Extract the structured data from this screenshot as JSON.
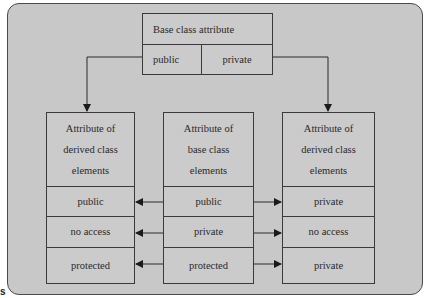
{
  "diagram": {
    "top_box": {
      "title": "Base class attribute",
      "cells": [
        "public",
        "private"
      ]
    },
    "columns": [
      {
        "id": "left",
        "header": [
          "Attribute of",
          "derived class",
          "elements"
        ],
        "rows": [
          "public",
          "no access",
          "protected"
        ]
      },
      {
        "id": "center",
        "header": [
          "Attribute of",
          "base class",
          "elements"
        ],
        "rows": [
          "public",
          "private",
          "protected"
        ]
      },
      {
        "id": "right",
        "header": [
          "Attribute of",
          "derived class",
          "elements"
        ],
        "rows": [
          "private",
          "no access",
          "private"
        ]
      }
    ],
    "edges": [
      {
        "from": "top.public",
        "to": "left.header"
      },
      {
        "from": "top.private",
        "to": "right.header"
      },
      {
        "from": "center.row0",
        "to": "left.row0"
      },
      {
        "from": "center.row1",
        "to": "left.row1"
      },
      {
        "from": "center.row2",
        "to": "left.row2"
      },
      {
        "from": "center.row0",
        "to": "right.row0"
      },
      {
        "from": "center.row1",
        "to": "right.row1"
      },
      {
        "from": "center.row2",
        "to": "right.row2"
      }
    ],
    "corner_label": "s"
  },
  "colors": {
    "panel_bg": "#c8c8c8",
    "border": "#3a3a3a",
    "text": "#2a2a2a"
  }
}
